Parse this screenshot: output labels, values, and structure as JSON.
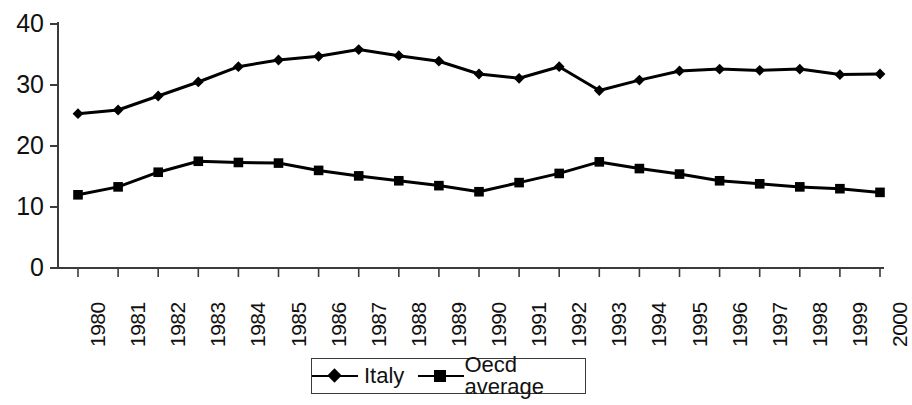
{
  "chart_data": {
    "type": "line",
    "title": "",
    "subtitle": "",
    "xlabel": "",
    "ylabel": "",
    "categories": [
      "1980",
      "1981",
      "1982",
      "1983",
      "1984",
      "1985",
      "1986",
      "1987",
      "1988",
      "1989",
      "1990",
      "1991",
      "1992",
      "1993",
      "1994",
      "1995",
      "1996",
      "1997",
      "1998",
      "1999",
      "2000"
    ],
    "series": [
      {
        "name": "Italy",
        "marker": "diamond",
        "color": "#000000",
        "values": [
          25.3,
          25.9,
          28.2,
          30.5,
          33.0,
          34.1,
          34.7,
          35.8,
          34.8,
          33.9,
          31.8,
          31.1,
          33.0,
          29.1,
          30.8,
          32.3,
          32.6,
          32.4,
          32.6,
          31.7,
          31.8
        ]
      },
      {
        "name": "Oecd average",
        "marker": "square",
        "color": "#000000",
        "values": [
          12.0,
          13.3,
          15.7,
          17.5,
          17.3,
          17.2,
          16.0,
          15.1,
          14.3,
          13.5,
          12.5,
          14.0,
          15.5,
          17.4,
          16.3,
          15.4,
          14.3,
          13.8,
          13.3,
          13.0,
          12.4
        ]
      }
    ],
    "ylim": [
      0,
      40
    ],
    "yticks": [
      0,
      10,
      20,
      30,
      40
    ],
    "ytick_labels": [
      "0",
      "10",
      "20",
      "30",
      "40"
    ],
    "grid": false,
    "legend_position": "bottom"
  },
  "axes": {
    "y_tick_labels": [
      "40",
      "30",
      "20",
      "10",
      "0"
    ],
    "x_tick_labels": [
      "1980",
      "1981",
      "1982",
      "1983",
      "1984",
      "1985",
      "1986",
      "1987",
      "1988",
      "1989",
      "1990",
      "1991",
      "1992",
      "1993",
      "1994",
      "1995",
      "1996",
      "1997",
      "1998",
      "1999",
      "2000"
    ]
  },
  "legend": {
    "entries": [
      {
        "label": "Italy",
        "marker": "diamond"
      },
      {
        "label": "Oecd average",
        "marker": "square"
      }
    ]
  }
}
